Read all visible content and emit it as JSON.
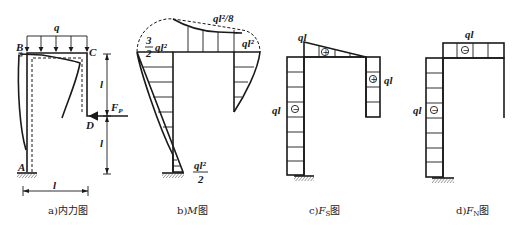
{
  "figure": {
    "panels": [
      {
        "id": "a",
        "caption": "a)内力图",
        "labels": {
          "load": "q",
          "node_A": "A",
          "node_B": "B",
          "node_C": "C",
          "node_D": "D",
          "force": "F",
          "force_sub": "P",
          "dim_upper": "l",
          "dim_lower": "l",
          "dim_width": "l"
        }
      },
      {
        "id": "b",
        "caption_prefix": "b)",
        "caption_italic": "M",
        "caption_suffix": "图",
        "labels": {
          "left_top_num": "3",
          "left_top_den": "2",
          "left_top_var": "ql²",
          "mid_span": "ql²/8",
          "right_top": "ql²",
          "base_num": "ql²",
          "base_den": "2"
        }
      },
      {
        "id": "c",
        "caption_prefix": "c)",
        "caption_italic": "F",
        "caption_sub": "S",
        "caption_suffix": "图",
        "labels": {
          "beam_value": "ql",
          "right_value": "ql",
          "left_value": "ql",
          "beam_sign": "+",
          "right_sign": "+",
          "left_sign": "−"
        }
      },
      {
        "id": "d",
        "caption_prefix": "d)",
        "caption_italic": "F",
        "caption_sub": "N",
        "caption_suffix": "图",
        "labels": {
          "beam_value": "ql",
          "left_value": "ql",
          "beam_sign": "−",
          "left_sign": "−"
        }
      }
    ]
  }
}
